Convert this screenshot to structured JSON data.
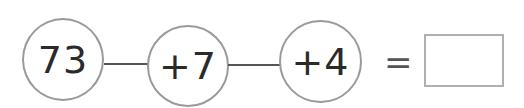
{
  "chain": {
    "start": "73",
    "steps": [
      "+7",
      "+4"
    ],
    "equals": "=",
    "answer": ""
  },
  "colors": {
    "circle_border": "#9a9a9a",
    "text": "#2a2a2a",
    "line": "#555555",
    "box_border": "#b0b0b0"
  }
}
